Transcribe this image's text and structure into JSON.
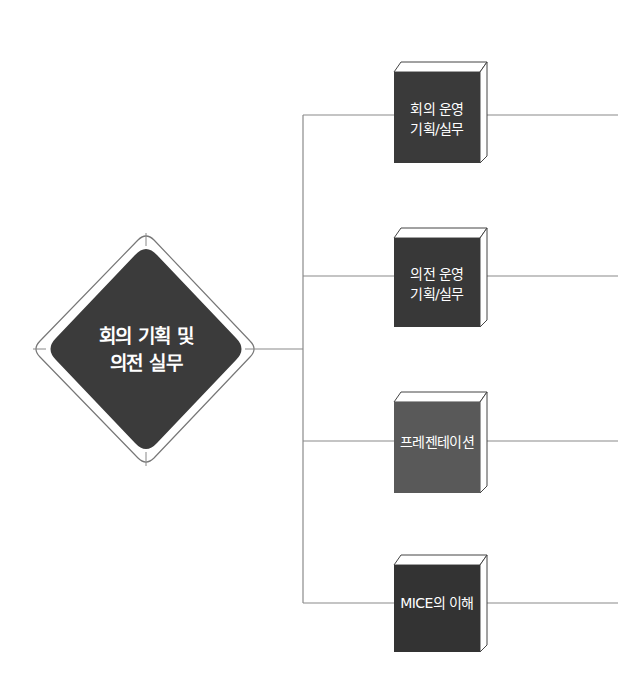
{
  "diagram": {
    "root": {
      "label_line1": "회의 기획 및",
      "label_line2": "의전 실무",
      "fill": "#3b3b3b"
    },
    "branches": [
      {
        "label_line1": "회의 운영",
        "label_line2": "기획/실무",
        "fill": "#3a3a3a",
        "top": 62,
        "height": 101,
        "line_y": 115
      },
      {
        "label_line1": "의전 운영",
        "label_line2": "기획/실무",
        "fill": "#383838",
        "top": 228,
        "height": 99,
        "line_y": 276
      },
      {
        "label_line1": "프레젠테이션",
        "label_line2": "",
        "fill": "#595959",
        "top": 392,
        "height": 101,
        "line_y": 441
      },
      {
        "label_line1": "MICE의 이해",
        "label_line2": "",
        "fill": "#333333",
        "top": 555,
        "height": 97,
        "line_y": 603
      }
    ],
    "colors": {
      "connector": "#8a8a8a",
      "outline": "#777777",
      "book_top": "#ffffff"
    }
  }
}
